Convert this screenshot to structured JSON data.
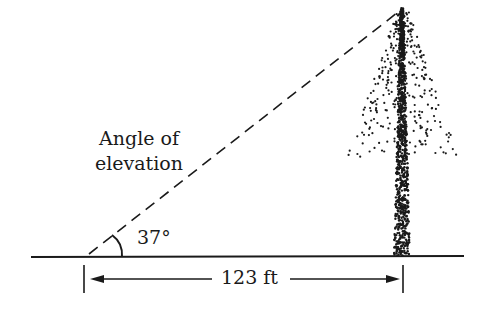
{
  "diagram": {
    "caption_line1": "Angle of",
    "caption_line2": "elevation",
    "angle_label": "37°",
    "distance_label": "123 ft",
    "angle_degrees": 37,
    "distance_ft": 123,
    "colors": {
      "ink": "#1a1a1a",
      "background": "#ffffff"
    },
    "elements": [
      "ground-line",
      "line-of-sight",
      "angle-arc",
      "tree",
      "distance-dimension"
    ]
  }
}
